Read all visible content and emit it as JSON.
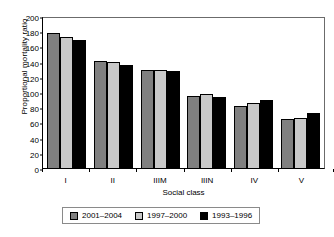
{
  "chart_data": {
    "type": "bar",
    "title": "",
    "xlabel": "Social class",
    "ylabel": "Proportional mortality ratio",
    "categories": [
      "I",
      "II",
      "IIIM",
      "IIIN",
      "IV",
      "V"
    ],
    "series": [
      {
        "name": "2001–2004",
        "color": "#808080",
        "values": [
          177,
          141,
          129,
          95,
          82,
          65
        ]
      },
      {
        "name": "1997–2000",
        "color": "#c9c9c9",
        "values": [
          172,
          139,
          129,
          97,
          85,
          66
        ]
      },
      {
        "name": "1993–1996",
        "color": "#000000",
        "values": [
          169,
          136,
          128,
          93,
          89,
          73
        ]
      }
    ],
    "ylim": [
      0,
      200
    ],
    "yticks": [
      0,
      20,
      40,
      60,
      80,
      100,
      120,
      140,
      160,
      180,
      200
    ],
    "ytick_labels": [
      "0",
      "20",
      "40",
      "60",
      "80",
      "100",
      "120",
      "140",
      "160",
      "180",
      "200"
    ],
    "grid": false,
    "legend_position": "bottom"
  }
}
